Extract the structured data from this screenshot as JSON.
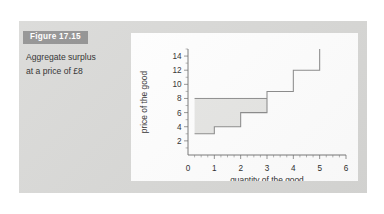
{
  "figure": {
    "number_label": "Figure 17.15",
    "caption": "Aggregate surplus at a price of £8",
    "card_color": "#d8d8d6",
    "badge_color": "#8d8d8d",
    "panel_color": "#ffffff"
  },
  "chart_data": {
    "type": "line",
    "subtype": "step",
    "title": "",
    "xlabel": "quantity of the good",
    "ylabel": "price of the good",
    "xlim": [
      0,
      6
    ],
    "ylim": [
      0,
      15
    ],
    "xticks": [
      0,
      1,
      2,
      3,
      4,
      5,
      6
    ],
    "xtick_labels": [
      "0",
      "1",
      "2",
      "3",
      "4",
      "5",
      "6"
    ],
    "yticks": [
      2,
      4,
      6,
      8,
      10,
      12,
      14
    ],
    "ytick_labels": [
      "2",
      "4",
      "6",
      "8",
      "10",
      "12",
      "14"
    ],
    "grid": false,
    "legend": "none",
    "series": [
      {
        "name": "supply step curve",
        "type": "step",
        "color": "#8a8a8a",
        "steps": [
          {
            "x_start": 0.25,
            "x_end": 1,
            "y": 3
          },
          {
            "x_start": 1,
            "x_end": 2,
            "y": 4
          },
          {
            "x_start": 2,
            "x_end": 3,
            "y": 6
          },
          {
            "x_start": 3,
            "x_end": 4,
            "y": 9
          },
          {
            "x_start": 4,
            "x_end": 5,
            "y": 12
          }
        ],
        "terminal_vertical": {
          "x": 5,
          "y_from": 12,
          "y_to": 15
        }
      },
      {
        "name": "market price line",
        "type": "horizontal-line",
        "color": "#8a8a8a",
        "y": 8,
        "x_start": 0.25,
        "x_end": 3
      }
    ],
    "shaded_region": {
      "name": "aggregate surplus",
      "fill": "#e6e6e4",
      "y_top": 8,
      "x_start": 0.25,
      "x_end": 3,
      "lower_boundary": "supply step curve"
    },
    "annotations": []
  }
}
